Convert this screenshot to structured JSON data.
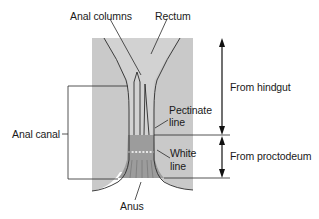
{
  "diagram": {
    "labels": {
      "anal_columns": "Anal columns",
      "rectum": "Rectum",
      "from_hindgut": "From hindgut",
      "pectinate_line_1": "Pectinate",
      "pectinate_line_2": "line",
      "white_line_1": "White",
      "white_line_2": "line",
      "from_proctodeum": "From proctodeum",
      "anal_canal": "Anal canal",
      "anus": "Anus"
    },
    "colors": {
      "background": "#ffffff",
      "tissue": "#c8c8c8",
      "canal_lumen": "#bdbdbd",
      "proctodeum_zone": "#9a9a9a",
      "line": "#2a2a2a",
      "white_line_dots": "#ffffff"
    }
  }
}
